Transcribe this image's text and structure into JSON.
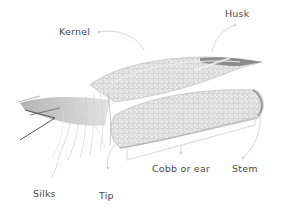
{
  "diagram": {
    "labels": {
      "kernel": "Kernel",
      "husk": "Husk",
      "silks": "Silks",
      "tip": "Tip",
      "cobb": "Cobb or ear",
      "stem": "Stem"
    },
    "colors": {
      "label_text": "#4a4a4a",
      "leader_line": "#d8d8d8",
      "corn_light": "#e6e6e6",
      "corn_mid": "#bdbdbd",
      "corn_dark": "#7a7a7a"
    }
  }
}
